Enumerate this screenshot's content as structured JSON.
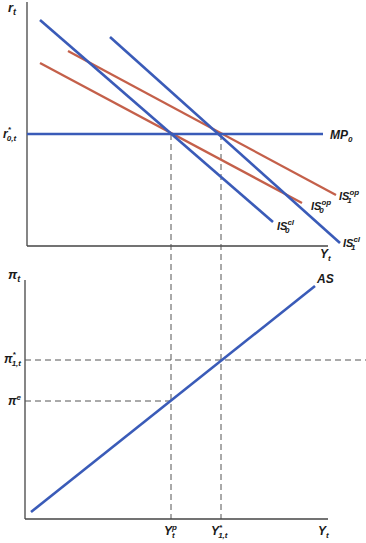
{
  "colors": {
    "blue": "#3a5bb8",
    "red": "#c4604a",
    "axis": "#444444",
    "dash": "#555555"
  },
  "top_panel": {
    "y_axis_label": "r",
    "y_axis_sub": "t",
    "x_axis_label": "Y",
    "x_axis_sub": "t",
    "r_star_label": "r",
    "r_star_sup": "*",
    "r_star_sub": "0,t",
    "curves": {
      "mp": {
        "name": "MP",
        "sub": "0"
      },
      "is0cl": {
        "name": "IS",
        "sub": "0",
        "sup": "cl"
      },
      "is1cl": {
        "name": "IS",
        "sub": "1",
        "sup": "cl"
      },
      "is0op": {
        "name": "IS",
        "sub": "0",
        "sup": "op"
      },
      "is1op": {
        "name": "IS",
        "sub": "1",
        "sup": "op"
      }
    }
  },
  "bottom_panel": {
    "y_axis_label": "π",
    "y_axis_sub": "t",
    "x_axis_label": "Y",
    "x_axis_sub": "t",
    "pi_star_label": "π",
    "pi_star_sup": "*",
    "pi_star_sub": "1,t",
    "pi_e_label": "π",
    "pi_e_sup": "e",
    "as_label": "AS",
    "yp_label": "Y",
    "yp_sup": "p",
    "yp_sub": "t",
    "ystar_label": "Y",
    "ystar_sup": "*",
    "ystar_sub": "1,t"
  }
}
